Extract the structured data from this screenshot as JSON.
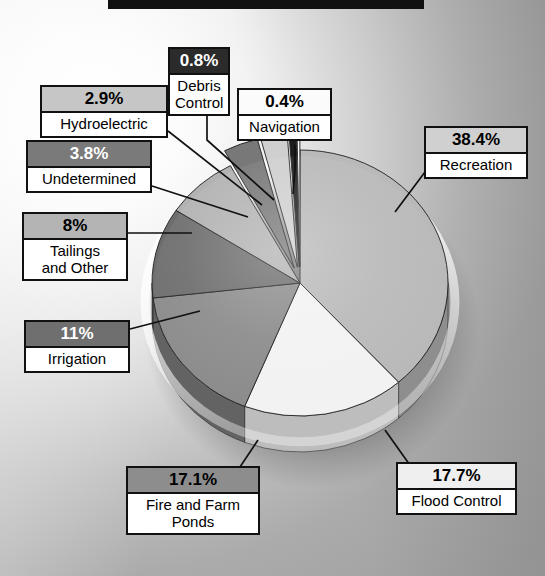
{
  "title_banner": {
    "present": true,
    "color": "#111111"
  },
  "background": {
    "type": "radial-gradient-grayscale",
    "light": "#ffffff",
    "dark": "#9e9e9e"
  },
  "chart_data": {
    "type": "pie",
    "title": "",
    "subtitle": "",
    "xlabel": "",
    "ylabel": "",
    "units": "percent",
    "total": 100.0,
    "style": "3d-exploded-grayscale",
    "legend_position": "callout-labels",
    "grid": false,
    "labels": [
      "Recreation",
      "Flood Control",
      "Fire and Farm Ponds",
      "Irrigation",
      "Tailings and Other",
      "Undetermined",
      "Hydroelectric",
      "Debris Control",
      "Navigation"
    ],
    "values": [
      38.4,
      17.7,
      17.1,
      11.0,
      8.0,
      3.8,
      2.9,
      0.8,
      0.4
    ],
    "value_labels": [
      "38.4%",
      "17.7%",
      "17.1%",
      "11%",
      "8%",
      "3.8%",
      "2.9%",
      "0.8%",
      "0.4%"
    ],
    "colors": [
      "#b9b9b9",
      "#f2f2f2",
      "#8b8b8b",
      "#6d6d6d",
      "#b2b2b2",
      "#787878",
      "#cfcfcf",
      "#1d1d1d",
      "#ffffff"
    ],
    "slices": [
      {
        "name": "Recreation",
        "value": 38.4,
        "value_label": "38.4%",
        "color": "#b9b9b9",
        "side_color": "#8e8e8e",
        "start_deg": 0.0,
        "end_deg": 138.24,
        "exploded": false,
        "label_text_color": "#000000"
      },
      {
        "name": "Flood Control",
        "value": 17.7,
        "value_label": "17.7%",
        "color": "#f2f2f2",
        "side_color": "#bdbdbd",
        "start_deg": 138.24,
        "end_deg": 201.96,
        "exploded": false,
        "label_text_color": "#000000"
      },
      {
        "name": "Fire and Farm Ponds",
        "value": 17.1,
        "value_label": "17.1%",
        "color": "#8b8b8b",
        "side_color": "#636363",
        "start_deg": 201.96,
        "end_deg": 263.52,
        "exploded": false,
        "label_text_color": "#000000"
      },
      {
        "name": "Irrigation",
        "value": 11.0,
        "value_label": "11%",
        "color": "#6d6d6d",
        "side_color": "#4c4c4c",
        "start_deg": 263.52,
        "end_deg": 303.12,
        "exploded": false,
        "label_text_color": "#ffffff"
      },
      {
        "name": "Tailings and Other",
        "value": 8.0,
        "value_label": "8%",
        "color": "#b2b2b2",
        "side_color": "#888888",
        "start_deg": 303.12,
        "end_deg": 331.92,
        "exploded": false,
        "label_text_color": "#000000"
      },
      {
        "name": "Undetermined",
        "value": 3.8,
        "value_label": "3.8%",
        "color": "#787878",
        "side_color": "#545454",
        "start_deg": 331.92,
        "end_deg": 345.6,
        "exploded": true,
        "label_text_color": "#ffffff"
      },
      {
        "name": "Hydroelectric",
        "value": 2.9,
        "value_label": "2.9%",
        "color": "#cfcfcf",
        "side_color": "#a0a0a0",
        "start_deg": 345.6,
        "end_deg": 356.04,
        "exploded": true,
        "label_text_color": "#000000"
      },
      {
        "name": "Debris Control",
        "value": 0.8,
        "value_label": "0.8%",
        "color": "#1d1d1d",
        "side_color": "#111111",
        "start_deg": 356.04,
        "end_deg": 358.92,
        "exploded": true,
        "label_text_color": "#ffffff"
      },
      {
        "name": "Navigation",
        "value": 0.4,
        "value_label": "0.4%",
        "color": "#ffffff",
        "side_color": "#cdcdcd",
        "start_deg": 358.92,
        "end_deg": 360.0,
        "exploded": true,
        "label_text_color": "#000000"
      }
    ]
  },
  "callouts": {
    "debris_control": {
      "pct": "0.8%",
      "name": "Debris\nControl",
      "header_bg": "#2b2b2b",
      "header_fg": "#ffffff"
    },
    "navigation": {
      "pct": "0.4%",
      "name": "Navigation",
      "header_bg": "#fbfbfb",
      "header_fg": "#000000"
    },
    "hydroelectric": {
      "pct": "2.9%",
      "name": "Hydroelectric",
      "header_bg": "#c6c6c6",
      "header_fg": "#000000"
    },
    "undetermined": {
      "pct": "3.8%",
      "name": "Undetermined",
      "header_bg": "#7a7a7a",
      "header_fg": "#ffffff"
    },
    "tailings": {
      "pct": "8%",
      "name": "Tailings\nand Other",
      "header_bg": "#b4b4b4",
      "header_fg": "#000000"
    },
    "irrigation": {
      "pct": "11%",
      "name": "Irrigation",
      "header_bg": "#6f6f6f",
      "header_fg": "#ffffff"
    },
    "fire_farm_ponds": {
      "pct": "17.1%",
      "name": "Fire and Farm\nPonds",
      "header_bg": "#8d8d8d",
      "header_fg": "#000000"
    },
    "flood_control": {
      "pct": "17.7%",
      "name": "Flood Control",
      "header_bg": "#efefef",
      "header_fg": "#000000"
    },
    "recreation": {
      "pct": "38.4%",
      "name": "Recreation",
      "header_bg": "#d0d0d0",
      "header_fg": "#000000"
    }
  }
}
